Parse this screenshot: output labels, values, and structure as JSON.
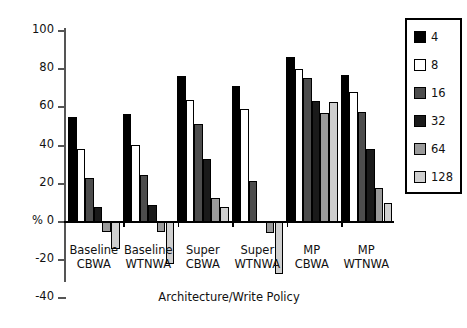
{
  "chart_data": {
    "type": "bar",
    "title": "",
    "xlabel": "Architecture/Write Policy",
    "ylabel": "%",
    "ylim": [
      -40,
      100
    ],
    "yticks": [
      -40,
      -20,
      0,
      20,
      40,
      60,
      80,
      100
    ],
    "ytick_labels": [
      "-40",
      "-20",
      "% 0",
      "20",
      "40",
      "60",
      "80",
      "100"
    ],
    "grid": false,
    "legend_position": "right",
    "legend_title": "",
    "categories": [
      "Baseline\nCBWA",
      "Baseline\nWTNWA",
      "Super\nCBWA",
      "Super\nWTNWA",
      "MP\nCBWA",
      "MP\nWTNWA"
    ],
    "category_lines": [
      [
        "Baseline",
        "CBWA"
      ],
      [
        "Baseline",
        "WTNWA"
      ],
      [
        "Super",
        "CBWA"
      ],
      [
        "Super",
        "WTNWA"
      ],
      [
        "MP",
        "CBWA"
      ],
      [
        "MP",
        "WTNWA"
      ]
    ],
    "series": [
      {
        "name": "4",
        "color": "#000000",
        "values": [
          55,
          56.5,
          76.5,
          71,
          86.5,
          77
        ]
      },
      {
        "name": "8",
        "color": "#ffffff",
        "values": [
          38,
          40.5,
          64,
          59,
          80,
          68
        ]
      },
      {
        "name": "16",
        "color": "#4d4d4d",
        "values": [
          23,
          24.5,
          51.5,
          21.5,
          75.5,
          57.5
        ]
      },
      {
        "name": "32",
        "color": "#1a1a1a",
        "values": [
          8,
          9,
          33,
          null,
          63.5,
          38
        ]
      },
      {
        "name": "64",
        "color": "#9a9a9a",
        "values": [
          -5,
          -5,
          12.5,
          -6,
          57,
          18
        ]
      },
      {
        "name": "128",
        "color": "#cfcfcf",
        "values": [
          -14,
          -22,
          8,
          -27,
          63,
          10
        ]
      }
    ]
  },
  "legend": {
    "entries": [
      {
        "label": "4",
        "color": "#000000"
      },
      {
        "label": "8",
        "color": "#ffffff"
      },
      {
        "label": "16",
        "color": "#4d4d4d"
      },
      {
        "label": "32",
        "color": "#1a1a1a"
      },
      {
        "label": "64",
        "color": "#9a9a9a"
      },
      {
        "label": "128",
        "color": "#cfcfcf"
      }
    ]
  }
}
